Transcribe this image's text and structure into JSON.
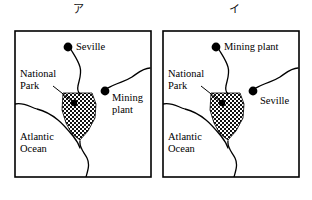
{
  "figure": {
    "panels": [
      {
        "caption": "ア",
        "labels": {
          "city": "Seville",
          "park": "National\nPark",
          "plant": "Mining\nplant",
          "ocean": "Atlantic\nOcean"
        }
      },
      {
        "caption": "イ",
        "labels": {
          "plant": "Mining plant",
          "park": "National\nPark",
          "city": "Seville",
          "ocean": "Atlantic\nOcean"
        }
      }
    ],
    "colors": {
      "ink": "#000000",
      "paper": "#ffffff",
      "hatch": "#1a1a1a"
    }
  }
}
